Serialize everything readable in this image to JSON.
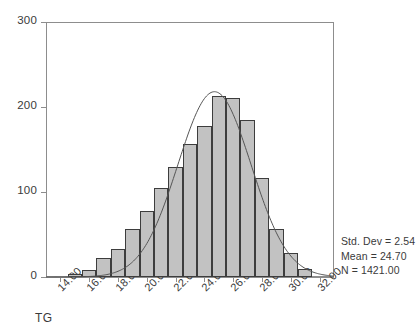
{
  "chart_data": {
    "type": "bar",
    "title": "",
    "subtitle": "",
    "xlabel": "TG",
    "ylabel": "",
    "xlim": [
      13.0,
      33.0
    ],
    "ylim": [
      0,
      300
    ],
    "grid": false,
    "legend": null,
    "bin_width": 1.0,
    "x_tick_labels": [
      "14.00",
      "16.00",
      "18.00",
      "20.00",
      "22.00",
      "24.00",
      "26.00",
      "28.00",
      "30.00",
      "32.00"
    ],
    "x_tick_values": [
      14.0,
      16.0,
      18.0,
      20.0,
      22.0,
      24.0,
      26.0,
      28.0,
      30.0,
      32.0
    ],
    "y_tick_labels": [
      "0",
      "100",
      "200",
      "300"
    ],
    "y_tick_values": [
      0,
      100,
      200,
      300
    ],
    "categories": [
      "15.00",
      "16.00",
      "17.00",
      "18.00",
      "19.00",
      "20.00",
      "21.00",
      "22.00",
      "23.00",
      "24.00",
      "25.00",
      "26.00",
      "27.00",
      "28.00",
      "29.00",
      "30.00",
      "31.00"
    ],
    "bin_centers": [
      15.0,
      16.0,
      17.0,
      18.0,
      19.0,
      20.0,
      21.0,
      22.0,
      23.0,
      24.0,
      25.0,
      26.0,
      27.0,
      28.0,
      29.0,
      30.0,
      31.0
    ],
    "values": [
      4,
      8,
      22,
      33,
      57,
      78,
      105,
      130,
      157,
      178,
      213,
      211,
      185,
      117,
      57,
      28,
      10
    ],
    "overlay": {
      "type": "normal-curve",
      "mean": 24.7,
      "std_dev": 2.54,
      "n": 1421,
      "peak_value": 218
    }
  },
  "stats": {
    "std_dev_label": "Std. Dev = 2.54",
    "mean_label": "Mean = 24.70",
    "n_label": "N = 1421.00"
  },
  "colors": {
    "bar_fill": "#c2c2c2",
    "bar_edge": "#3d3d3d",
    "axis": "#8d8d8d",
    "curve": "#555555",
    "text": "#3a3a3a",
    "background": "#ffffff"
  }
}
